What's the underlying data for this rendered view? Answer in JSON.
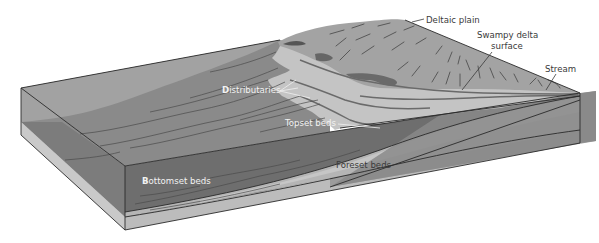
{
  "diagram": {
    "labels": {
      "deltaic_plain": "Deltaic plain",
      "swampy_delta_surface_line1": "Swampy delta",
      "swampy_delta_surface_line2": "surface",
      "stream": "Stream",
      "distributaries_first": "D",
      "distributaries_rest": "istributaries",
      "topset_beds": "Topset beds",
      "foreset_beds": "Foreset beds",
      "bottomset_first": "B",
      "bottomset_rest": "ottomset beds"
    },
    "colors": {
      "background": "#ffffff",
      "water_top": "#9a9a9a",
      "water_front": "#8a8a8a",
      "bottomset": "#6e6e6e",
      "foreset_light": "#b8b8b8",
      "foreset_mid": "#a5a5a5",
      "deltaic_plain": "#a3a3a3",
      "swampy_surface": "#c4c4c4",
      "distributary_channels": "#d3d3d3",
      "base_layer": "#c9c9c9",
      "right_face": "#8f8f8f",
      "text_dark": "#3a3a3a",
      "text_light": "#f2f2f2"
    }
  }
}
